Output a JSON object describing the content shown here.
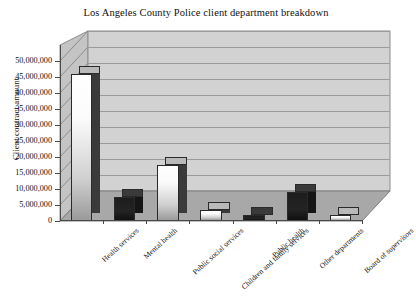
{
  "chart_data": {
    "type": "bar",
    "title": "Los Angeles County Police client department breakdown",
    "xlabel": "",
    "ylabel": "Client contract amount",
    "categories": [
      "Health services",
      "Mental health",
      "Public social services",
      "Children and family services",
      "Public health",
      "Other departments",
      "Board of supervisors"
    ],
    "values": [
      46000000,
      7500000,
      17500000,
      3500000,
      2000000,
      9000000,
      2000000
    ],
    "ylim": [
      0,
      50000000
    ],
    "ytick_values": [
      0,
      5000000,
      10000000,
      15000000,
      20000000,
      25000000,
      30000000,
      35000000,
      40000000,
      45000000,
      50000000
    ],
    "ytick_labels": [
      "0",
      "5,000,000",
      "10,000,000",
      "15,000,000",
      "20,000,000",
      "25,000,000",
      "30,000,000",
      "35,000,000",
      "40,000,000",
      "45,000,000",
      "50,000,000"
    ],
    "grid": true,
    "legend": false,
    "style": "3d-column",
    "bar_shades": [
      "light",
      "dark",
      "light",
      "light",
      "dark",
      "dark",
      "light"
    ],
    "colors": {
      "plot_back_wall": "#d2d2d2",
      "plot_floor": "#a8a8a8",
      "side_wall": "#c4c4c4",
      "gridline": "#9a9a9a",
      "axis": "#4a4a4a",
      "bar_light": "#ffffff",
      "bar_dark": "#1d1d1d",
      "background": "#ffffff",
      "text": "#111111"
    }
  }
}
